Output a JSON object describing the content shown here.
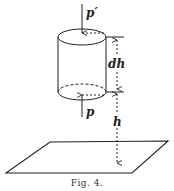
{
  "figure": {
    "caption": "Fig. 4.",
    "labels": {
      "top_pressure": "p′",
      "bottom_pressure": "p",
      "cylinder_height": "dh",
      "height_above_plane": "h"
    }
  },
  "colors": {
    "ink": "#222222",
    "background": "#ffffff"
  }
}
